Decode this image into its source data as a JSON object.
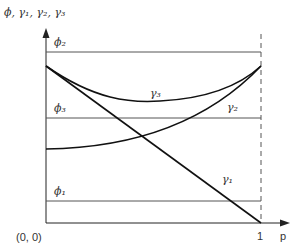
{
  "axes": {
    "y_label": "ϕ, γ₁, γ₂, γ₃",
    "x_label": "p",
    "origin_label": "(0, 0)",
    "x_tick_label": "1"
  },
  "levels": [
    {
      "name": "phi2",
      "label": "ϕ₂"
    },
    {
      "name": "phi3",
      "label": "ϕ₃"
    },
    {
      "name": "phi1",
      "label": "ϕ₁"
    }
  ],
  "curves": [
    {
      "name": "gamma1",
      "label": "γ₁",
      "shape": "straight line decreasing from top-left to (1, 0)"
    },
    {
      "name": "gamma2",
      "label": "γ₂",
      "shape": "increasing convex curve"
    },
    {
      "name": "gamma3",
      "label": "γ₃",
      "shape": "U-shaped curve"
    }
  ],
  "colors": {
    "line": "#111111",
    "reference": "#555555",
    "background": "#ffffff"
  }
}
